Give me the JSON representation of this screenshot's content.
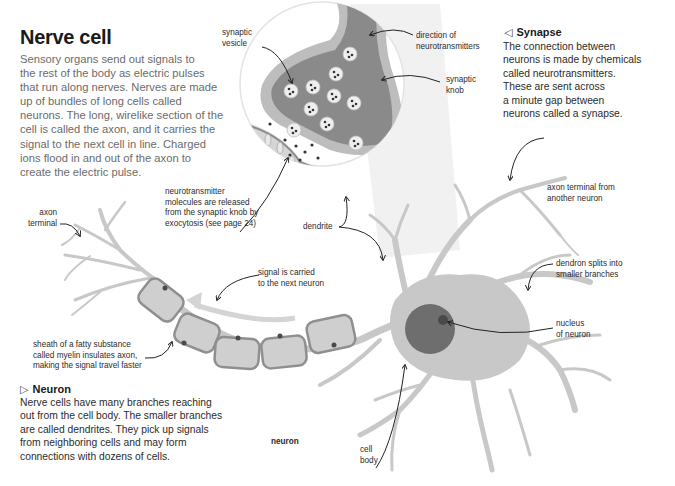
{
  "title": "Nerve cell",
  "intro": "Sensory organs send out signals to\nthe rest of the body as electric pulses\nthat run along nerves. Nerves are made\nup of bundles of long cells called\nneurons. The long, wirelike section of the\ncell is called the axon, and it carries the\nsignal to the next cell in line. Charged\nions flood in and out of the axon to\ncreate the electric pulse.",
  "synapse_box": {
    "marker": "◁",
    "heading": "Synapse",
    "body": "The connection between\nneurons is made by chemicals\ncalled neurotransmitters.\nThese are sent across\na minute gap between\nneurons called a synapse."
  },
  "neuron_box": {
    "marker": "▷",
    "heading": "Neuron",
    "body": "Nerve cells have many branches reaching\nout from the cell body. The smaller branches\nare called dendrites. They pick up signals\nfrom neighboring cells and may form\nconnections with dozens of cells."
  },
  "labels": {
    "synaptic_vesicle": "synaptic\nvesicle",
    "direction_of_neurotransmitters": "direction of\nneurotransmitters",
    "synaptic_knob": "synaptic\nknob",
    "neurotransmitter_release": "neurotransmitter\nmolecules are released\nfrom the synaptic knob by\nexocytosis (see page 24)",
    "dendrite": "dendrite",
    "axon_terminal": "axon\nterminal",
    "axon_terminal_other": "axon terminal from\nanother neuron",
    "dendron_splits": "dendron splits into\nsmaller branches",
    "signal_carried": "signal is carried\nto the next neuron",
    "nucleus": "nucleus\nof neuron",
    "myelin_sheath": "sheath of a fatty substance\ncalled myelin insulates axon,\nmaking the signal travel faster",
    "cell_body": "cell\nbody",
    "neuron_caption": "neuron"
  },
  "colors": {
    "neuron_gray": "#c8c8c8",
    "knob_dark": "#8a8a8a",
    "knob_rim": "#bdbdbd",
    "nucleus": "#6e6e6e",
    "nucleolus": "#4a4a4a",
    "myelin_fill": "#cfcfcf",
    "myelin_edge": "#8f8f8f",
    "text_gray": "#6b6b6b"
  }
}
